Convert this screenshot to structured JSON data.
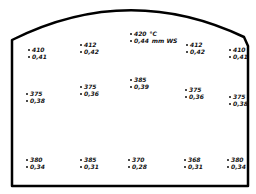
{
  "diagram": {
    "outline": "arched-top chamber cross-section",
    "units": {
      "temperature": "°C",
      "pressure": "mm WS"
    },
    "points": [
      {
        "id": "p1",
        "temp": "410",
        "pressure": "0,41",
        "x": 28,
        "y": 46
      },
      {
        "id": "p2",
        "temp": "412",
        "pressure": "0,42",
        "x": 80,
        "y": 41
      },
      {
        "id": "p3",
        "temp": "420",
        "pressure": "0,44",
        "x": 130,
        "y": 30,
        "temp_unit": "°C",
        "pressure_unit": "mm WS"
      },
      {
        "id": "p4",
        "temp": "412",
        "pressure": "0,42",
        "x": 186,
        "y": 41
      },
      {
        "id": "p5",
        "temp": "410",
        "pressure": "0,41",
        "x": 229,
        "y": 46
      },
      {
        "id": "p6",
        "temp": "375",
        "pressure": "0,38",
        "x": 26,
        "y": 90
      },
      {
        "id": "p7",
        "temp": "375",
        "pressure": "0,36",
        "x": 80,
        "y": 83
      },
      {
        "id": "p8",
        "temp": "385",
        "pressure": "0,39",
        "x": 130,
        "y": 76
      },
      {
        "id": "p9",
        "temp": "375",
        "pressure": "0,36",
        "x": 185,
        "y": 86
      },
      {
        "id": "p10",
        "temp": "375",
        "pressure": "0,38",
        "x": 229,
        "y": 93
      },
      {
        "id": "p11",
        "temp": "380",
        "pressure": "0,34",
        "x": 26,
        "y": 156
      },
      {
        "id": "p12",
        "temp": "385",
        "pressure": "0,31",
        "x": 80,
        "y": 156
      },
      {
        "id": "p13",
        "temp": "370",
        "pressure": "0,28",
        "x": 128,
        "y": 156
      },
      {
        "id": "p14",
        "temp": "368",
        "pressure": "0,31",
        "x": 184,
        "y": 156
      },
      {
        "id": "p15",
        "temp": "380",
        "pressure": "0,34",
        "x": 227,
        "y": 156
      }
    ]
  }
}
